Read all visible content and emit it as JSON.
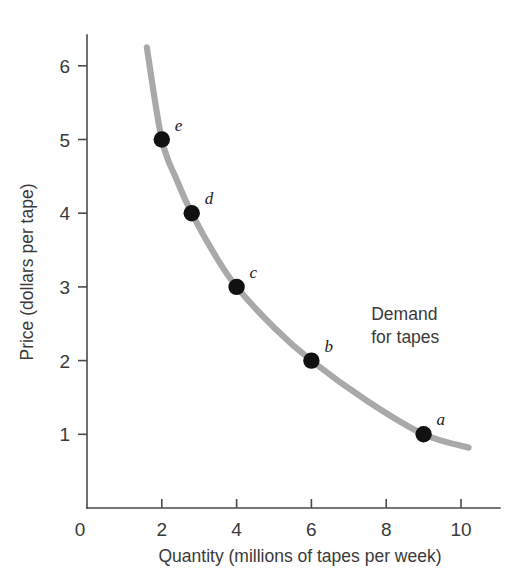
{
  "chart_data": {
    "type": "line",
    "title": "",
    "subtitle": "",
    "xlabel": "Quantity (millions of tapes per week)",
    "ylabel": "Price (dollars per tape)",
    "xlim": [
      0,
      10.6
    ],
    "ylim": [
      0,
      6.6
    ],
    "grid": false,
    "legend_position": "none",
    "x_ticks": [
      "0",
      "2",
      "4",
      "6",
      "8",
      "10"
    ],
    "x_tick_values": [
      0,
      2,
      4,
      6,
      8,
      10
    ],
    "y_ticks": [
      "1",
      "2",
      "3",
      "4",
      "5",
      "6"
    ],
    "y_tick_values": [
      1,
      2,
      3,
      4,
      5,
      6
    ],
    "series": [
      {
        "name": "Demand for tapes",
        "color": "#a9a9a9",
        "x": [
          1.6,
          2.0,
          2.4,
          2.8,
          3.4,
          4.0,
          5.0,
          6.0,
          7.5,
          9.0,
          10.2
        ],
        "y": [
          6.25,
          5.0,
          4.45,
          4.0,
          3.45,
          3.0,
          2.45,
          2.0,
          1.45,
          1.0,
          0.82
        ]
      }
    ],
    "points": [
      {
        "label": "e",
        "x": 2.0,
        "y": 5.0,
        "label_dx": 13,
        "label_dy": -9
      },
      {
        "label": "d",
        "x": 2.8,
        "y": 4.0,
        "label_dx": 13,
        "label_dy": -9
      },
      {
        "label": "c",
        "x": 4.0,
        "y": 3.0,
        "label_dx": 13,
        "label_dy": -9
      },
      {
        "label": "b",
        "x": 6.0,
        "y": 2.0,
        "label_dx": 13,
        "label_dy": -9
      },
      {
        "label": "a",
        "x": 9.0,
        "y": 1.0,
        "label_dx": 13,
        "label_dy": -9
      }
    ],
    "annotations": [
      {
        "name": "demand-curve-label",
        "line1": "Demand",
        "line2": "for tapes",
        "x": 7.6,
        "y": 2.55
      }
    ],
    "colors": {
      "curve": "#a9a9a9",
      "point": "#111111",
      "axis": "#4a4a4a",
      "text": "#3a3a3a",
      "background": "#ffffff"
    }
  }
}
